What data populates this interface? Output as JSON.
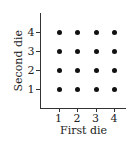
{
  "chart_data": {
    "type": "scatter",
    "title": "",
    "xlabel": "First die",
    "ylabel": "Second die",
    "x_ticks": [
      "1",
      "2",
      "3",
      "4"
    ],
    "y_ticks": [
      "1",
      "2",
      "3",
      "4"
    ],
    "xlim": [
      0,
      4.5
    ],
    "ylim": [
      0,
      4.5
    ],
    "grid": false,
    "legend": null,
    "points": [
      {
        "x": 1,
        "y": 1
      },
      {
        "x": 2,
        "y": 1
      },
      {
        "x": 3,
        "y": 1
      },
      {
        "x": 4,
        "y": 1
      },
      {
        "x": 1,
        "y": 2
      },
      {
        "x": 2,
        "y": 2
      },
      {
        "x": 3,
        "y": 2
      },
      {
        "x": 4,
        "y": 2
      },
      {
        "x": 1,
        "y": 3
      },
      {
        "x": 2,
        "y": 3
      },
      {
        "x": 3,
        "y": 3
      },
      {
        "x": 4,
        "y": 3
      },
      {
        "x": 1,
        "y": 4
      },
      {
        "x": 2,
        "y": 4
      },
      {
        "x": 3,
        "y": 4
      },
      {
        "x": 4,
        "y": 4
      }
    ],
    "point_color": "#111111"
  }
}
